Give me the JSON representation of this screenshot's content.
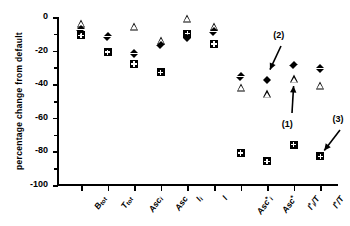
{
  "chart_data": {
    "type": "scatter",
    "title": "",
    "xlabel": "",
    "ylabel": "percentage  change  from  default",
    "ylim": [
      -100,
      0
    ],
    "yticks": [
      0,
      -20,
      -40,
      -60,
      -80,
      -100
    ],
    "ytick_labels": [
      "0",
      "-20",
      "-40",
      "-60",
      "-80",
      "-100"
    ],
    "grid": false,
    "legend": "none",
    "categories": [
      "B_tot",
      "T_tot",
      "Asc_i",
      "Asc",
      "I_i",
      "I",
      "Asc*_i",
      "Asc*",
      "I*_i/T",
      "I*/T"
    ],
    "category_labels": [
      {
        "base": "B",
        "sub": "tot",
        "sup": ""
      },
      {
        "base": "T",
        "sub": "tot",
        "sup": ""
      },
      {
        "base": "Asc",
        "sub": "i",
        "sup": ""
      },
      {
        "base": "Asc",
        "sub": "",
        "sup": ""
      },
      {
        "base": "I",
        "sub": "i",
        "sup": ""
      },
      {
        "base": "I",
        "sub": "",
        "sup": ""
      },
      {
        "base": "Asc",
        "sub": "i",
        "sup": "*"
      },
      {
        "base": "Asc",
        "sub": "",
        "sup": "*"
      },
      {
        "base": "I",
        "sub": "i",
        "sup": "*",
        "suffix": "/T"
      },
      {
        "base": "I",
        "sub": "",
        "sup": "*",
        "suffix": "/T"
      }
    ],
    "series": [
      {
        "name": "diamond",
        "marker": "filled-diamond",
        "values": [
          -5,
          -9,
          -19,
          -14,
          -10,
          -6,
          -33,
          -35,
          -26,
          -28
        ]
      },
      {
        "name": "triangle",
        "marker": "open-triangle",
        "values": [
          -4,
          null,
          -6,
          -14,
          -1,
          -6,
          -42,
          -46,
          -37,
          -41
        ]
      },
      {
        "name": "square",
        "marker": "crossed-square",
        "values": [
          -11,
          -21,
          -28,
          -33,
          -10,
          -16,
          -81,
          -86,
          -76,
          -83
        ]
      }
    ],
    "annotations": [
      {
        "label": "(1)",
        "target_category": "I*_i/T",
        "target_series": "triangle",
        "direction": "up-right"
      },
      {
        "label": "(2)",
        "target_category": "Asc*",
        "target_series": "diamond",
        "direction": "down-left"
      },
      {
        "label": "(3)",
        "target_category": "I*/T",
        "target_series": "square",
        "direction": "down-left"
      }
    ]
  }
}
